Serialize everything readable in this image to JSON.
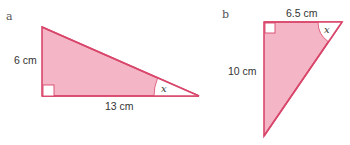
{
  "colors": {
    "fill": "#f4b6c6",
    "stroke": "#d9466b",
    "angle_fill": "#ffffff"
  },
  "diagrams": [
    {
      "label": "a",
      "sides": {
        "vertical": "6 cm",
        "horizontal": "13 cm"
      },
      "angle": "x",
      "right_angle_at": "bottom-left"
    },
    {
      "label": "b",
      "sides": {
        "horizontal": "6.5 cm",
        "vertical": "10 cm"
      },
      "angle": "x",
      "right_angle_at": "top-left"
    }
  ]
}
